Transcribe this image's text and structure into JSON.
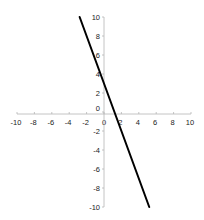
{
  "chart_data": {
    "type": "line",
    "title": "",
    "xlabel": "",
    "ylabel": "",
    "xlim": [
      -10,
      10
    ],
    "ylim": [
      -10,
      10
    ],
    "grid": false,
    "legend": null,
    "x_ticks": [
      -10,
      -8,
      -6,
      -4,
      -2,
      0,
      2,
      4,
      6,
      8,
      10
    ],
    "y_ticks": [
      -10,
      -8,
      -6,
      -4,
      -2,
      0,
      2,
      4,
      6,
      8,
      10
    ],
    "x_tick_labels": [
      "-10",
      "-8",
      "-6",
      "-4",
      "-2",
      "0",
      "2",
      "4",
      "6",
      "8",
      "10"
    ],
    "y_tick_labels": [
      "-10",
      "-8",
      "-6",
      "-4",
      "-2",
      "0",
      "2",
      "4",
      "6",
      "8",
      "10"
    ],
    "series": [
      {
        "name": "line",
        "color": "#000000",
        "x": [
          -2.8,
          5.2
        ],
        "y": [
          10,
          -10
        ],
        "approx_equation": "y = -2.5x + 3"
      }
    ]
  },
  "layout": {
    "origin_px": [
      104,
      112
    ],
    "x_px_per_unit": 8.7,
    "y_px_per_unit": 9.5,
    "axis_color": "#b5b5b5",
    "label_color": "#222222"
  }
}
